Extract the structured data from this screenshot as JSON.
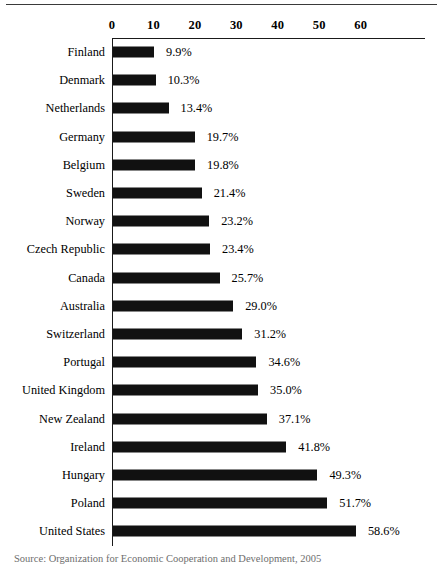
{
  "chart_data": {
    "type": "bar",
    "orientation": "horizontal",
    "title": "",
    "xlabel": "",
    "ylabel": "",
    "xlim": [
      0,
      75.5
    ],
    "axis_ticks": [
      0,
      10,
      20,
      30,
      40,
      50,
      60
    ],
    "grid": false,
    "legend": null,
    "bar_color": "#111111",
    "categories": [
      "Finland",
      "Denmark",
      "Netherlands",
      "Germany",
      "Belgium",
      "Sweden",
      "Norway",
      "Czech Republic",
      "Canada",
      "Australia",
      "Switzerland",
      "Portugal",
      "United Kingdom",
      "New Zealand",
      "Ireland",
      "Hungary",
      "Poland",
      "United States"
    ],
    "values": [
      9.9,
      10.3,
      13.4,
      19.7,
      19.8,
      21.4,
      23.2,
      23.4,
      25.7,
      29.0,
      31.2,
      34.6,
      35.0,
      37.1,
      41.8,
      49.3,
      51.7,
      58.6
    ],
    "data_labels": [
      "9.9%",
      "10.3%",
      "13.4%",
      "19.7%",
      "19.8%",
      "21.4%",
      "23.2%",
      "23.4%",
      "25.7%",
      "29.0%",
      "31.2%",
      "34.6%",
      "35.0%",
      "37.1%",
      "41.8%",
      "49.3%",
      "51.7%",
      "58.6%"
    ]
  },
  "source_note": "Source: Organization for Economic Cooperation and Development, 2005"
}
